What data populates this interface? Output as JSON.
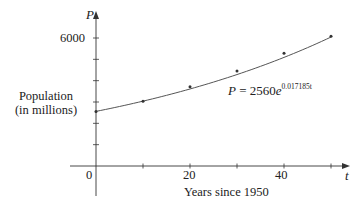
{
  "chart_data": {
    "type": "scatter",
    "title": "",
    "xlabel": "Years since 1950",
    "ylabel": "Population (in millions)",
    "x_axis_symbol": "t",
    "y_axis_symbol": "P",
    "x_ticks": [
      0,
      10,
      20,
      30,
      40,
      50
    ],
    "x_tick_labels": [
      {
        "value": 0,
        "label": "0"
      },
      {
        "value": 20,
        "label": "20"
      },
      {
        "value": 40,
        "label": "40"
      }
    ],
    "y_ticks": [
      1000,
      2000,
      3000,
      4000,
      5000,
      6000
    ],
    "y_tick_labels": [
      {
        "value": 6000,
        "label": "6000"
      }
    ],
    "xlim": [
      -5,
      54
    ],
    "ylim": [
      -1400,
      7200
    ],
    "grid": false,
    "legend": "none",
    "series": [
      {
        "name": "Observed population",
        "kind": "points",
        "x": [
          0,
          10,
          20,
          30,
          40,
          50
        ],
        "values": [
          2560,
          3040,
          3710,
          4450,
          5280,
          6080
        ]
      },
      {
        "name": "Exponential model",
        "kind": "curve",
        "formula": "P = 2560e^(0.017185t)",
        "a": 2560,
        "k": 0.017185,
        "t_range": [
          0,
          50
        ]
      }
    ],
    "annotations": [
      {
        "text_lhs": "P",
        "text_eq": " = 2560",
        "text_base": "e",
        "text_exp": "0.017185t",
        "near": {
          "t": 30,
          "P": 3700
        }
      }
    ]
  },
  "labels": {
    "y_symbol": "P",
    "x_symbol": "t",
    "y_label_line1": "Population",
    "y_label_line2": "(in millions)",
    "x_label": "Years since 1950",
    "origin": "0",
    "tick_20": "20",
    "tick_40": "40",
    "tick_6000": "6000",
    "eq_lhs": "P",
    "eq_mid": " = 2560",
    "eq_base": "e",
    "eq_exp": "0.017185t"
  },
  "colors": {
    "axis": "#333333",
    "curve": "#555555",
    "points": "#333333",
    "text": "#222222"
  }
}
